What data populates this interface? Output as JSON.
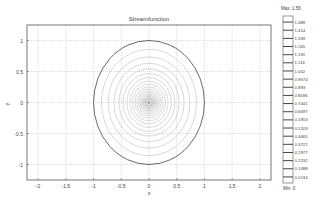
{
  "chart_data": {
    "type": "contour",
    "title": "Streamfunction",
    "xlabel": "x",
    "ylabel": "y",
    "xlim": [
      -2.2,
      2.2
    ],
    "ylim": [
      -1.25,
      1.25
    ],
    "x_ticks": [
      "-2",
      "-1.5",
      "-1",
      "-0.5",
      "0",
      "0.5",
      "1",
      "1.5",
      "2"
    ],
    "y_ticks": [
      "1",
      "0.5",
      "0",
      "-0.5",
      "-1"
    ],
    "grid": true,
    "boundary_circle": {
      "center": [
        0,
        0
      ],
      "radius": 1
    },
    "contour_center": [
      0,
      0
    ],
    "colorbar": {
      "max_label": "Max: 1.56",
      "min_label": "Min: 0",
      "levels": [
        "1.488",
        "1.414",
        "1.339",
        "1.265",
        "1.191",
        "1.116",
        "1.042",
        "0.9674",
        "0.893",
        "0.8186",
        "0.7441",
        "0.6697",
        "0.5953",
        "0.5209",
        "0.4465",
        "0.3721",
        "0.2977",
        "0.2232",
        "0.1488",
        "0.0744"
      ]
    }
  },
  "colors": {
    "frame": "#555555",
    "grid": "#bbbbbb",
    "boundary": "#444444",
    "contours": "#aaaaaa"
  }
}
